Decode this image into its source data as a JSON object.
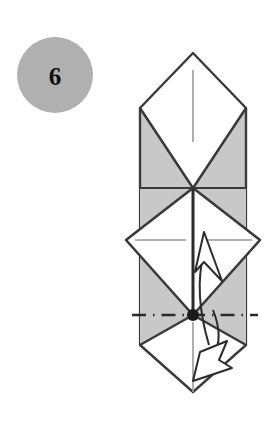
{
  "diagram": {
    "kind": "origami-fold-instruction",
    "step": {
      "number": "6",
      "badge_shape": "circle",
      "badge_fill": "#b0b0b0",
      "badge_center_x": 55,
      "badge_center_y": 75,
      "badge_radius": 38,
      "badge_text_color": "#111111"
    },
    "colors": {
      "paper_front": "#ffffff",
      "paper_back": "#c8c8c8",
      "outline": "#3a3a3a",
      "crease_line": "#8a8a8a",
      "fold_line": "#2b2b2b",
      "arrow_stroke": "#2b2b2b",
      "arrow_fill": "#ffffff",
      "pivot_dot": "#1a1a1a",
      "background": "#ffffff"
    },
    "geometry": {
      "apex_top": {
        "x": 193,
        "y": 53
      },
      "shoulder_left": {
        "x": 140,
        "y": 108
      },
      "shoulder_right": {
        "x": 246,
        "y": 108
      },
      "cross_center": {
        "x": 193,
        "y": 188
      },
      "mid_left_vertex": {
        "x": 126,
        "y": 240
      },
      "mid_right_vertex": {
        "x": 260,
        "y": 240
      },
      "pivot_point": {
        "x": 193,
        "y": 315
      },
      "skirt_left": {
        "x": 140,
        "y": 345
      },
      "skirt_right": {
        "x": 246,
        "y": 345
      },
      "bottom_tip": {
        "x": 193,
        "y": 392
      },
      "band_left_x": 140,
      "band_right_x": 246
    },
    "elements": [
      {
        "name": "upper-white-diamond",
        "fill": "paper_front",
        "note": "top kite panel, point up"
      },
      {
        "name": "upper-left-gray-triangle",
        "fill": "paper_back",
        "note": "reverse side showing at left"
      },
      {
        "name": "upper-right-gray-triangle",
        "fill": "paper_back",
        "note": "reverse side showing at right"
      },
      {
        "name": "middle-white-diamond",
        "fill": "paper_front",
        "note": "large central square rotated 45 degrees"
      },
      {
        "name": "lower-left-gray-triangle",
        "fill": "paper_back"
      },
      {
        "name": "lower-right-gray-triangle",
        "fill": "paper_back"
      },
      {
        "name": "bottom-white-point",
        "fill": "paper_front",
        "note": "lower tip of the model"
      },
      {
        "name": "vertical-center-crease",
        "style": "thin solid",
        "note": "valley reference on upper panel"
      },
      {
        "name": "horizontal-center-crease",
        "style": "thin solid",
        "note": "reference line across middle diamond"
      },
      {
        "name": "vertical-fold-line",
        "style": "bold solid",
        "note": "spine from cross center to pivot"
      },
      {
        "name": "horizontal-dash-dot-axis",
        "style": "dash-dot",
        "note": "fold axis through the pivot point"
      },
      {
        "name": "pivot-dot",
        "style": "filled circle"
      },
      {
        "name": "up-arrow",
        "style": "hollow arrowhead",
        "note": "bring the flap up"
      },
      {
        "name": "down-arrow",
        "style": "hollow arrowhead",
        "note": "swing the flap back down"
      }
    ],
    "annotations": {
      "fold_axis_label": "",
      "arrow_up_meaning": "fold flap upward",
      "arrow_down_meaning": "return flap downward"
    }
  }
}
